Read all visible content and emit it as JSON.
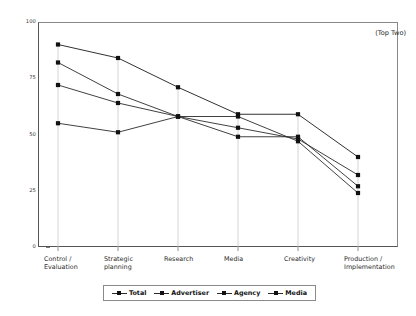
{
  "annotation": {
    "top_right": "(Top Two)"
  },
  "chart_data": {
    "type": "line",
    "title": "",
    "xlabel": "",
    "ylabel": "",
    "ylim": [
      0,
      100
    ],
    "yticks": [
      0,
      25,
      50,
      75,
      100
    ],
    "ytick_labels": [
      "0",
      "25",
      "50",
      "75",
      "100"
    ],
    "grid": false,
    "legend_position": "bottom",
    "annotation": "(Top Two)",
    "categories": [
      "Control /\nEvaluation",
      "Strategic\nplanning",
      "Research",
      "Media",
      "Creativity",
      "Production /\nImplementation"
    ],
    "category_labels": [
      "Control / Evaluation",
      "Strategic planning",
      "Research",
      "Media",
      "Creativity",
      "Production / Implementation"
    ],
    "series": [
      {
        "name": "Total",
        "values": [
          72,
          64,
          58,
          49,
          49,
          27
        ],
        "color": "#2b2b2b"
      },
      {
        "name": "Advertiser",
        "values": [
          82,
          68,
          58,
          53,
          48,
          32
        ],
        "color": "#2b2b2b"
      },
      {
        "name": "Agency",
        "values": [
          90,
          84,
          71,
          59,
          59,
          40
        ],
        "color": "#1a1a1a"
      },
      {
        "name": "Media",
        "values": [
          55,
          51,
          58,
          58,
          47,
          24
        ],
        "color": "#2b2b2b"
      }
    ]
  },
  "legend": {
    "items": [
      {
        "label": "Total"
      },
      {
        "label": "Advertiser"
      },
      {
        "label": "Agency"
      },
      {
        "label": "Media"
      }
    ]
  }
}
